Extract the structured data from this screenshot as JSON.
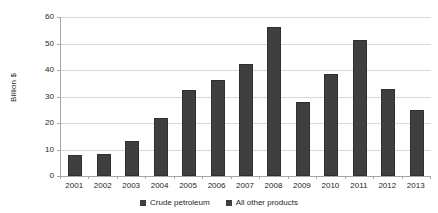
{
  "chart_data": {
    "type": "bar",
    "title": "",
    "xlabel": "",
    "ylabel": "Billion $",
    "ylim": [
      0,
      60
    ],
    "yticks": [
      0,
      10,
      20,
      30,
      40,
      50,
      60
    ],
    "grid": true,
    "legend_position": "bottom",
    "categories": [
      "2001",
      "2002",
      "2003",
      "2004",
      "2005",
      "2006",
      "2007",
      "2008",
      "2009",
      "2010",
      "2011",
      "2012",
      "2013"
    ],
    "series": [
      {
        "name": "Crude petroleum",
        "color": "#3f3f3f",
        "values": [
          7.8,
          8.3,
          13.2,
          21.8,
          32.6,
          36.1,
          42.2,
          56.2,
          27.9,
          38.4,
          51.5,
          32.7,
          24.8
        ]
      }
    ],
    "legend": [
      {
        "label": "Crude petroleum",
        "color": "#3f3f3f"
      },
      {
        "label": "All other products",
        "color": "#3f3f3f"
      }
    ]
  }
}
